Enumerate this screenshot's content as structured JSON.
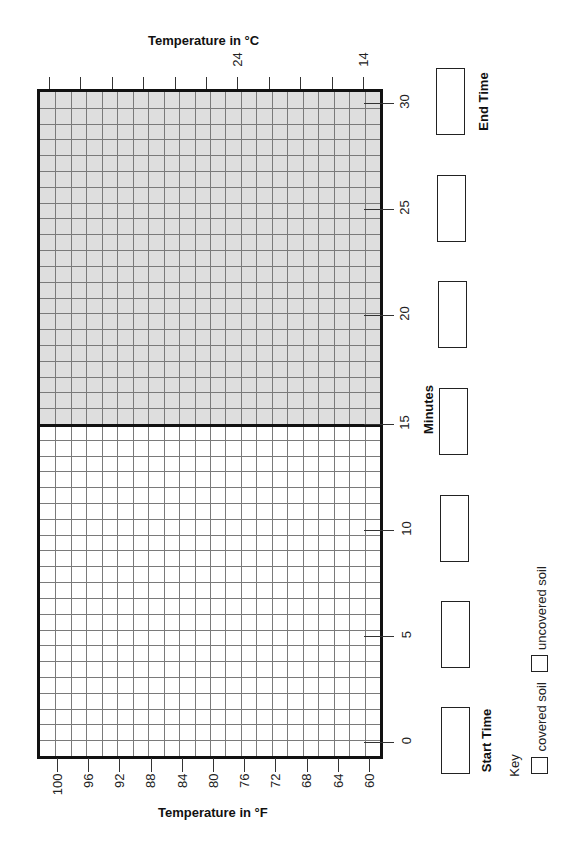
{
  "chart_data": {
    "type": "line",
    "orientation": "rotated-90-ccw",
    "title": "",
    "xlabel": "Minutes",
    "ylabel_primary": "Temperature in °F",
    "ylabel_secondary": "Temperature in °C",
    "x_ticks": [
      0,
      5,
      10,
      15,
      20,
      25,
      30
    ],
    "x_range": [
      0,
      30
    ],
    "y_fahrenheit_ticks": [
      100,
      96,
      92,
      88,
      84,
      80,
      76,
      72,
      68,
      64,
      60
    ],
    "y_fahrenheit_range": [
      60,
      100
    ],
    "y_celsius_labeled_ticks": [
      24,
      14
    ],
    "grid": true,
    "shaded_region": {
      "from_minute": 15,
      "to_minute": 30,
      "color": "#dedede"
    },
    "series": [
      {
        "name": "covered soil",
        "values": []
      },
      {
        "name": "uncovered soil",
        "values": []
      }
    ],
    "legend_position": "bottom-right"
  },
  "axes": {
    "celsius_title": "Temperature in °C",
    "celsius_labels": [
      "24",
      "14"
    ],
    "fahrenheit_title": "Temperature in °F",
    "fahrenheit_labels": [
      "100",
      "96",
      "92",
      "88",
      "84",
      "80",
      "76",
      "72",
      "68",
      "64",
      "60"
    ],
    "minutes_title": "Minutes",
    "minute_labels": [
      "30",
      "25",
      "20",
      "15",
      "10",
      "5",
      "0"
    ]
  },
  "time_boxes": {
    "end_label": "End Time",
    "start_label": "Start Time"
  },
  "key": {
    "title": "Key",
    "items": [
      {
        "label": "covered soil"
      },
      {
        "label": "uncovered soil"
      }
    ]
  },
  "colors": {
    "shaded": "#dedede",
    "grid_line": "#7a7a7a",
    "border": "#111111"
  }
}
